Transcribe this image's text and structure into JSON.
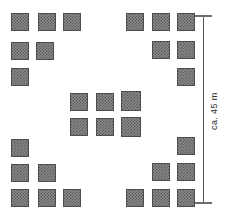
{
  "figure": {
    "type": "site-layout-plan",
    "background_color": "#ffffff",
    "module_fill_color": "#8a8a8a",
    "module_border_color": "#4d4d4d",
    "dimension_color": "#595959"
  },
  "dimension": {
    "label": "ca. 45 m",
    "orientation": "vertical",
    "value": 45,
    "unit": "m",
    "approximate_prefix": "ca.",
    "x": 203,
    "y_top": 15,
    "y_bottom": 202,
    "cap_width": 17
  },
  "module": {
    "width": 18,
    "height": 18
  },
  "clusters": [
    {
      "name": "top-left",
      "modules": [
        {
          "x": 11,
          "y": 13,
          "w": 18,
          "h": 18
        },
        {
          "x": 38,
          "y": 13,
          "w": 18,
          "h": 18
        },
        {
          "x": 63,
          "y": 13,
          "w": 18,
          "h": 18
        },
        {
          "x": 11,
          "y": 42,
          "w": 18,
          "h": 18
        },
        {
          "x": 36,
          "y": 42,
          "w": 18,
          "h": 18
        },
        {
          "x": 11,
          "y": 68,
          "w": 18,
          "h": 18
        }
      ]
    },
    {
      "name": "top-right",
      "modules": [
        {
          "x": 126,
          "y": 13,
          "w": 18,
          "h": 18
        },
        {
          "x": 152,
          "y": 13,
          "w": 18,
          "h": 18
        },
        {
          "x": 177,
          "y": 13,
          "w": 18,
          "h": 18
        },
        {
          "x": 152,
          "y": 41,
          "w": 18,
          "h": 18
        },
        {
          "x": 177,
          "y": 41,
          "w": 18,
          "h": 18
        },
        {
          "x": 177,
          "y": 68,
          "w": 18,
          "h": 18
        }
      ]
    },
    {
      "name": "center",
      "modules": [
        {
          "x": 70,
          "y": 93,
          "w": 18,
          "h": 18
        },
        {
          "x": 96,
          "y": 93,
          "w": 18,
          "h": 18
        },
        {
          "x": 121,
          "y": 91,
          "w": 20,
          "h": 20
        },
        {
          "x": 70,
          "y": 118,
          "w": 18,
          "h": 18
        },
        {
          "x": 96,
          "y": 118,
          "w": 18,
          "h": 18
        },
        {
          "x": 121,
          "y": 117,
          "w": 20,
          "h": 20
        }
      ]
    },
    {
      "name": "bottom-left",
      "modules": [
        {
          "x": 11,
          "y": 139,
          "w": 18,
          "h": 18
        },
        {
          "x": 11,
          "y": 164,
          "w": 18,
          "h": 18
        },
        {
          "x": 38,
          "y": 164,
          "w": 18,
          "h": 18
        },
        {
          "x": 11,
          "y": 189,
          "w": 18,
          "h": 18
        },
        {
          "x": 38,
          "y": 189,
          "w": 18,
          "h": 18
        },
        {
          "x": 63,
          "y": 189,
          "w": 18,
          "h": 18
        }
      ]
    },
    {
      "name": "bottom-right",
      "modules": [
        {
          "x": 177,
          "y": 137,
          "w": 18,
          "h": 18
        },
        {
          "x": 152,
          "y": 163,
          "w": 18,
          "h": 18
        },
        {
          "x": 177,
          "y": 163,
          "w": 18,
          "h": 18
        },
        {
          "x": 126,
          "y": 189,
          "w": 18,
          "h": 18
        },
        {
          "x": 152,
          "y": 189,
          "w": 18,
          "h": 18
        },
        {
          "x": 177,
          "y": 189,
          "w": 18,
          "h": 18
        }
      ]
    }
  ]
}
